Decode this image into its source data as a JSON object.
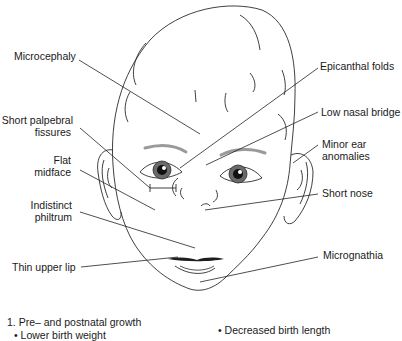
{
  "labels": {
    "microcephaly": "Microcephaly",
    "short_palpebral_1": "Short palpebral",
    "short_palpebral_2": "fissures",
    "flat_midface_1": "Flat",
    "flat_midface_2": "midface",
    "indistinct_philtrum_1": "Indistinct",
    "indistinct_philtrum_2": "philtrum",
    "thin_upper_lip": "Thin upper lip",
    "epicanthal_folds": "Epicanthal folds",
    "low_nasal_bridge": "Low nasal bridge",
    "minor_ear_1": "Minor ear",
    "minor_ear_2": "anomalies",
    "short_nose": "Short nose",
    "micrognathia": "Micrognathia"
  },
  "footer": {
    "item1": "1. Pre– and postnatal growth",
    "bullet_left": "• Lower birth weight",
    "bullet_right": "• Decreased birth length"
  },
  "colors": {
    "line": "#2a2a2a",
    "brow": "#9a9a9a",
    "iris": "#555555"
  }
}
